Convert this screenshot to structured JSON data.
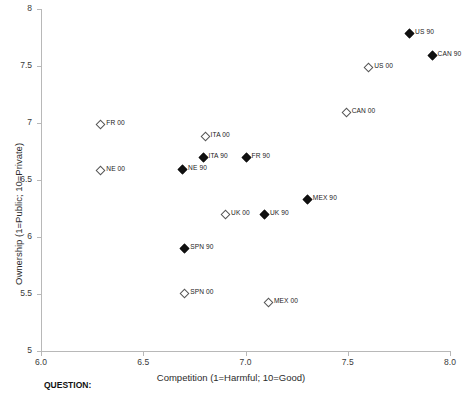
{
  "chart_data": {
    "type": "scatter",
    "title": "",
    "xlabel": "Competition (1=Harmful; 10=Good)",
    "ylabel": "Ownership (1=Public; 10=Private)",
    "xlim": [
      6.0,
      8.0
    ],
    "ylim": [
      5.0,
      8.0
    ],
    "xticks": [
      "6.0",
      "6.5",
      "7.0",
      "7.5",
      "8.0"
    ],
    "xtick_values": [
      6.0,
      6.5,
      7.0,
      7.5,
      8.0
    ],
    "yticks": [
      "5",
      "5.5",
      "6",
      "6.5",
      "7",
      "7.5",
      "8"
    ],
    "ytick_values": [
      5,
      5.5,
      6,
      6.5,
      7,
      7.5,
      8
    ],
    "grid": false,
    "legend": "none",
    "marker_styles": {
      "90": "filled-diamond",
      "00": "hollow-diamond"
    },
    "points": [
      {
        "label": "US 90",
        "x": 7.8,
        "y": 7.79,
        "marker": "filled"
      },
      {
        "label": "CAN 90",
        "x": 7.91,
        "y": 7.6,
        "marker": "filled"
      },
      {
        "label": "US 00",
        "x": 7.6,
        "y": 7.49,
        "marker": "hollow"
      },
      {
        "label": "CAN 00",
        "x": 7.49,
        "y": 7.1,
        "marker": "hollow"
      },
      {
        "label": "FR 00",
        "x": 6.29,
        "y": 6.99,
        "marker": "hollow"
      },
      {
        "label": "ITA 00",
        "x": 6.8,
        "y": 6.89,
        "marker": "hollow"
      },
      {
        "label": "ITA 90",
        "x": 6.79,
        "y": 6.7,
        "marker": "filled"
      },
      {
        "label": "FR 90",
        "x": 7.0,
        "y": 6.7,
        "marker": "filled"
      },
      {
        "label": "NE 00",
        "x": 6.29,
        "y": 6.59,
        "marker": "hollow"
      },
      {
        "label": "NE 90",
        "x": 6.69,
        "y": 6.6,
        "marker": "filled"
      },
      {
        "label": "MEX 90",
        "x": 7.3,
        "y": 6.33,
        "marker": "filled"
      },
      {
        "label": "UK 00",
        "x": 6.9,
        "y": 6.2,
        "marker": "hollow"
      },
      {
        "label": "UK 90",
        "x": 7.09,
        "y": 6.2,
        "marker": "filled"
      },
      {
        "label": "SPN 90",
        "x": 6.7,
        "y": 5.9,
        "marker": "filled"
      },
      {
        "label": "SPN 00",
        "x": 6.7,
        "y": 5.51,
        "marker": "hollow"
      },
      {
        "label": "MEX 00",
        "x": 7.11,
        "y": 5.43,
        "marker": "hollow"
      }
    ]
  },
  "footer": {
    "question_label": "QUESTION:"
  }
}
